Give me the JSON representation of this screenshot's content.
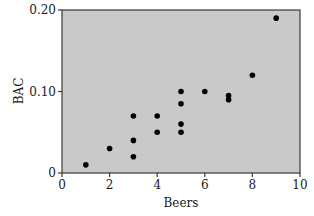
{
  "chart_data": {
    "type": "scatter",
    "title": "",
    "xlabel": "Beers",
    "ylabel": "BAC",
    "xlim": [
      0,
      10
    ],
    "ylim": [
      0,
      0.2
    ],
    "xticks": [
      0,
      2,
      4,
      6,
      8,
      10
    ],
    "xtick_labels": [
      "0",
      "2",
      "4",
      "6",
      "8",
      "10"
    ],
    "yticks": [
      0,
      0.1,
      0.2
    ],
    "ytick_labels": [
      "0",
      "0.10",
      "0.20"
    ],
    "grid": false,
    "legend": null,
    "background_color": "#c9c9c9",
    "marker_color": "#000000",
    "points": [
      {
        "x": 1,
        "y": 0.01
      },
      {
        "x": 2,
        "y": 0.03
      },
      {
        "x": 3,
        "y": 0.02
      },
      {
        "x": 3,
        "y": 0.04
      },
      {
        "x": 3,
        "y": 0.07
      },
      {
        "x": 4,
        "y": 0.05
      },
      {
        "x": 4,
        "y": 0.07
      },
      {
        "x": 5,
        "y": 0.05
      },
      {
        "x": 5,
        "y": 0.06
      },
      {
        "x": 5,
        "y": 0.085
      },
      {
        "x": 5,
        "y": 0.1
      },
      {
        "x": 6,
        "y": 0.1
      },
      {
        "x": 7,
        "y": 0.09
      },
      {
        "x": 7,
        "y": 0.095
      },
      {
        "x": 8,
        "y": 0.12
      },
      {
        "x": 9,
        "y": 0.19
      }
    ]
  }
}
